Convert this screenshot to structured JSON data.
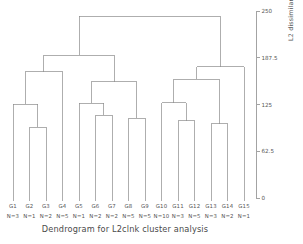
{
  "chart_data": {
    "type": "dendrogram",
    "title": "Dendrogram for L2clnk cluster analysis",
    "xlabel": "",
    "ylabel": "L2 dissimilarity measure",
    "ylim": [
      0,
      250
    ],
    "yticks": [
      0,
      62.5,
      125,
      187.5,
      250
    ],
    "ytick_labels": [
      "0",
      "62.5",
      "125",
      "187.5",
      "250"
    ],
    "axis_position": "right",
    "grid": false,
    "orientation": "vertical",
    "leaf_count": 15,
    "leaves": [
      {
        "label": "G1",
        "n_label": "N=3",
        "n": 3
      },
      {
        "label": "G2",
        "n_label": "N=1",
        "n": 1
      },
      {
        "label": "G3",
        "n_label": "N=2",
        "n": 2
      },
      {
        "label": "G4",
        "n_label": "N=5",
        "n": 5
      },
      {
        "label": "G5",
        "n_label": "N=1",
        "n": 1
      },
      {
        "label": "G6",
        "n_label": "N=2",
        "n": 2
      },
      {
        "label": "G7",
        "n_label": "N=2",
        "n": 2
      },
      {
        "label": "G8",
        "n_label": "N=5",
        "n": 5
      },
      {
        "label": "G9",
        "n_label": "N=5",
        "n": 5
      },
      {
        "label": "G10",
        "n_label": "N=10",
        "n": 10
      },
      {
        "label": "G11",
        "n_label": "N=3",
        "n": 3
      },
      {
        "label": "G12",
        "n_label": "N=5",
        "n": 5
      },
      {
        "label": "G13",
        "n_label": "N=3",
        "n": 3
      },
      {
        "label": "G14",
        "n_label": "N=2",
        "n": 2
      },
      {
        "label": "G15",
        "n_label": "N=1",
        "n": 1
      }
    ],
    "merges": [
      {
        "id": "m1",
        "left": "G2",
        "right": "G3",
        "height": 95
      },
      {
        "id": "m2",
        "left": "G1",
        "right": "m1",
        "height": 126
      },
      {
        "id": "m3",
        "left": "m2",
        "right": "G4",
        "height": 169
      },
      {
        "id": "m4",
        "left": "G6",
        "right": "G7",
        "height": 111
      },
      {
        "id": "m5",
        "left": "G5",
        "right": "m4",
        "height": 127
      },
      {
        "id": "m6",
        "left": "G8",
        "right": "G9",
        "height": 107
      },
      {
        "id": "m7",
        "left": "m5",
        "right": "m6",
        "height": 156
      },
      {
        "id": "m8",
        "left": "m3",
        "right": "m7",
        "height": 191
      },
      {
        "id": "m9",
        "left": "G11",
        "right": "G12",
        "height": 104
      },
      {
        "id": "m10",
        "left": "G10",
        "right": "m9",
        "height": 128
      },
      {
        "id": "m11",
        "left": "G13",
        "right": "G14",
        "height": 100
      },
      {
        "id": "m12",
        "left": "m10",
        "right": "m11",
        "height": 159
      },
      {
        "id": "m13",
        "left": "m12",
        "right": "G15",
        "height": 176
      },
      {
        "id": "m14",
        "left": "m8",
        "right": "m13",
        "height": 243
      }
    ],
    "line_color": "#8c8c8c",
    "axis_color": "#8c8c8c",
    "text_color": "#555555",
    "background": "#ffffff"
  }
}
